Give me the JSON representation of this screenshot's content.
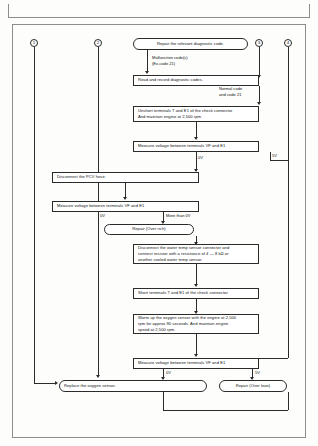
{
  "document": {
    "type": "diagnostic-flowchart",
    "title": "Oxygen sensor diagnostic flow chart"
  },
  "references": [
    {
      "id": "ref-1",
      "label": "1"
    },
    {
      "id": "ref-2",
      "label": "2"
    },
    {
      "id": "ref-3",
      "label": "3"
    },
    {
      "id": "ref-4",
      "label": "4"
    }
  ],
  "nodes": {
    "repair_code": {
      "lines": [
        "Repair the relevant diagnostic code."
      ]
    },
    "read_codes": {
      "lines": [
        "Read and record diagnostic codes."
      ]
    },
    "unshort_terminals": {
      "lines": [
        "Unshort terminals T and E1 of the check connector",
        "And maintain engine at 2,500 rpm."
      ]
    },
    "measure_voltage_1": {
      "lines": [
        "Measure voltage between terminals VF and E1"
      ]
    },
    "disconnect_pcv": {
      "lines": [
        "Disconnect the PCV hose."
      ]
    },
    "measure_voltage_2": {
      "lines": [
        "Measure voltage between terminals VF and E1"
      ]
    },
    "repair_over_rich": {
      "lines": [
        "Repair (Over rich)"
      ]
    },
    "disconnect_water_temp": {
      "lines": [
        "Disconnect the water temp sensor connector and",
        "connect resistor with a resistance of 4 — 8 kΩ or",
        "another cooled water temp sensor."
      ]
    },
    "short_terminals": {
      "lines": [
        "Short terminals T and E1 of the check connector"
      ]
    },
    "warm_up_sensor": {
      "lines": [
        "Warm up the oxygen sensor with the engine at 2,500",
        "rpm for approx 90 seconds. And maintain engine",
        "speed at 2,500 rpm."
      ]
    },
    "measure_voltage_3": {
      "lines": [
        "Measure voltage between terminals VF and E1"
      ]
    },
    "replace_sensor": {
      "lines": [
        "Replace the oxygen sensor."
      ]
    },
    "repair_over_lean": {
      "lines": [
        "Repair (Over lean)"
      ]
    }
  },
  "edge_labels": {
    "malfunction_code": {
      "lines": [
        "Malfunction code(s)",
        "(Ex.code 21)"
      ]
    },
    "normal_code": {
      "lines": [
        "Normal code",
        "and code 21"
      ]
    },
    "v0_a": {
      "lines": [
        "0V"
      ]
    },
    "v5_a": {
      "lines": [
        "5V"
      ]
    },
    "v0_b": {
      "lines": [
        "0V"
      ]
    },
    "more_than_0v": {
      "lines": [
        "More than 0V"
      ]
    },
    "v0_c": {
      "lines": [
        "0V"
      ]
    },
    "v5_c": {
      "lines": [
        "5V"
      ]
    }
  },
  "colors": {
    "line": "#2b2b2b",
    "frame": "#8d8d8d",
    "background": "#ffffff",
    "text": "#111111"
  }
}
